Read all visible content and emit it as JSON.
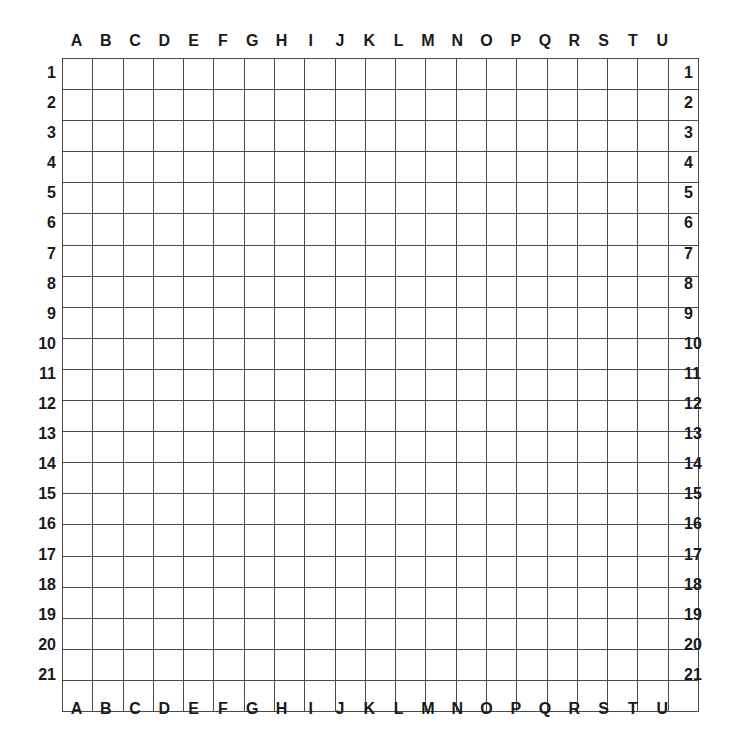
{
  "board": {
    "title": "Coordinate Grid Board",
    "columns": 21,
    "rows": 21,
    "column_labels": [
      "A",
      "B",
      "C",
      "D",
      "E",
      "F",
      "G",
      "H",
      "I",
      "J",
      "K",
      "L",
      "M",
      "N",
      "O",
      "P",
      "Q",
      "R",
      "S",
      "T",
      "U"
    ],
    "row_labels": [
      "1",
      "2",
      "3",
      "4",
      "5",
      "6",
      "7",
      "8",
      "9",
      "10",
      "11",
      "12",
      "13",
      "14",
      "15",
      "16",
      "17",
      "18",
      "19",
      "20",
      "21"
    ],
    "cell_contents": [],
    "colors": {
      "background": "#ffffff",
      "grid_line": "#4a4a4a",
      "label_text": "#1a1a1a",
      "cell_fill": "#ffffff"
    },
    "headers": {
      "top_visible": true,
      "bottom_visible": true,
      "left_visible": true,
      "right_visible": true
    }
  }
}
